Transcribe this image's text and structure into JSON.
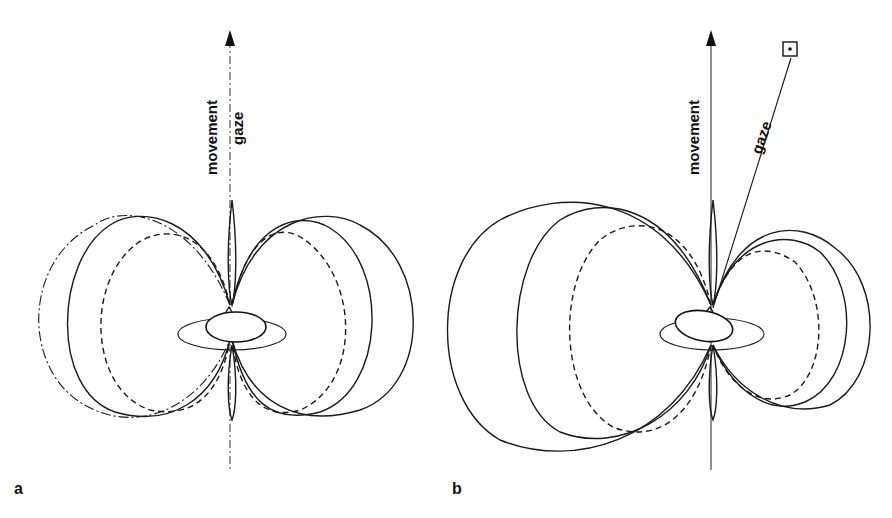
{
  "figure": {
    "panels": [
      {
        "id": "a",
        "label": "a",
        "axis_label": "movement",
        "gaze_label": "gaze"
      },
      {
        "id": "b",
        "label": "b",
        "axis_label": "movement",
        "gaze_label": "gaze"
      }
    ],
    "colors": {
      "ink": "#1a1a1a",
      "background": "#ffffff"
    }
  }
}
